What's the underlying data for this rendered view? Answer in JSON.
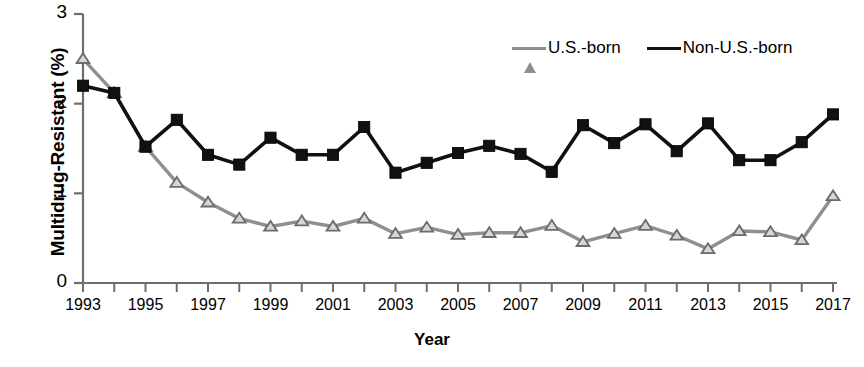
{
  "chart_data": {
    "type": "line",
    "title": "",
    "xlabel": "Year",
    "ylabel": "Multidrug-Resistant (%)",
    "x": [
      1993,
      1994,
      1995,
      1996,
      1997,
      1998,
      1999,
      2000,
      2001,
      2002,
      2003,
      2004,
      2005,
      2006,
      2007,
      2008,
      2009,
      2010,
      2011,
      2012,
      2013,
      2014,
      2015,
      2016,
      2017
    ],
    "xlim": [
      1993,
      2017
    ],
    "ylim": [
      0,
      3
    ],
    "xticks": [
      1993,
      1994,
      1995,
      1996,
      1997,
      1998,
      1999,
      2000,
      2001,
      2002,
      2003,
      2004,
      2005,
      2006,
      2007,
      2008,
      2009,
      2010,
      2011,
      2012,
      2013,
      2014,
      2015,
      2016,
      2017
    ],
    "xtick_labels": [
      "1993",
      "",
      "1995",
      "",
      "1997",
      "",
      "1999",
      "",
      "2001",
      "",
      "2003",
      "",
      "2005",
      "",
      "2007",
      "",
      "2009",
      "",
      "2011",
      "",
      "2013",
      "",
      "2015",
      "",
      "2017"
    ],
    "yticks": [
      0,
      1,
      2,
      3
    ],
    "ytick_labels": [
      "0",
      "1",
      "2",
      "3"
    ],
    "grid": false,
    "legend_position": "top-right",
    "series": [
      {
        "name": "U.S.-born",
        "color": "#8f8f8f",
        "marker": "triangle",
        "values": [
          2.5,
          2.12,
          1.52,
          1.12,
          0.9,
          0.72,
          0.63,
          0.69,
          0.63,
          0.72,
          0.55,
          0.62,
          0.54,
          0.56,
          0.56,
          0.64,
          0.46,
          0.55,
          0.64,
          0.53,
          0.38,
          0.58,
          0.57,
          0.48,
          0.97
        ]
      },
      {
        "name": "Non-U.S.-born",
        "color": "#111111",
        "marker": "square",
        "values": [
          2.2,
          2.12,
          1.52,
          1.82,
          1.43,
          1.32,
          1.62,
          1.43,
          1.43,
          1.74,
          1.23,
          1.34,
          1.45,
          1.53,
          1.44,
          1.24,
          1.76,
          1.56,
          1.77,
          1.47,
          1.78,
          1.37,
          1.37,
          1.57,
          1.88
        ]
      }
    ]
  },
  "legend": {
    "items": [
      {
        "label": "U.S.-born"
      },
      {
        "label": "Non-U.S.-born"
      }
    ]
  },
  "axes": {
    "y_title": "Multidrug-Resistant (%)",
    "x_title": "Year"
  }
}
